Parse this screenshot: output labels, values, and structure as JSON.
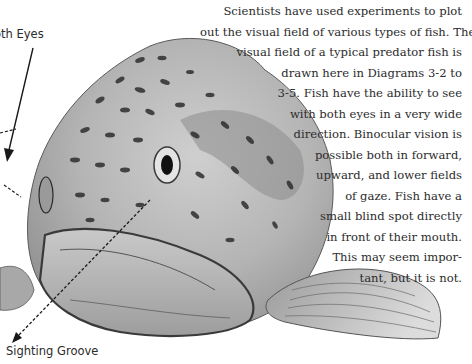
{
  "labels": {
    "top": "oth Eyes",
    "bottom": "Sighting Groove"
  },
  "paragraph": {
    "lines": [
      "Scientists have used experiments to plot",
      "out the visual field of various types of fish. The",
      "visual field of a typical predator fish is",
      "drawn here in Diagrams 3-2 to",
      "3-5. Fish have the ability to see",
      "with both eyes in a very wide",
      "direction. Binocular vision is",
      "possible both in forward,",
      "upward, and lower fields",
      "of gaze. Fish have a",
      "small blind spot directly",
      "in front of their mouth.",
      "This may seem impor-",
      "tant, but it is not."
    ]
  },
  "illustration": {
    "subject": "Predator fish (trout) head, front three-quarter view",
    "colors": {
      "ink": "#1e1e1e",
      "shade": "#8a8a8a",
      "light": "#d6d6d6"
    }
  }
}
